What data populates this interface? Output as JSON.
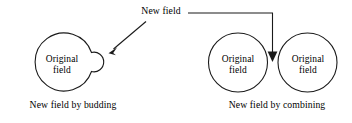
{
  "figure": {
    "stroke_color": "#1a1a1a",
    "background_color": "#ffffff",
    "callout": {
      "label": "New field"
    },
    "budding": {
      "original_field_line1": "Original",
      "original_field_line2": "field",
      "caption": "New field by budding"
    },
    "combining": {
      "left_field_line1": "Original",
      "left_field_line2": "field",
      "right_field_line1": "Original",
      "right_field_line2": "field",
      "caption": "New field by combining"
    }
  }
}
